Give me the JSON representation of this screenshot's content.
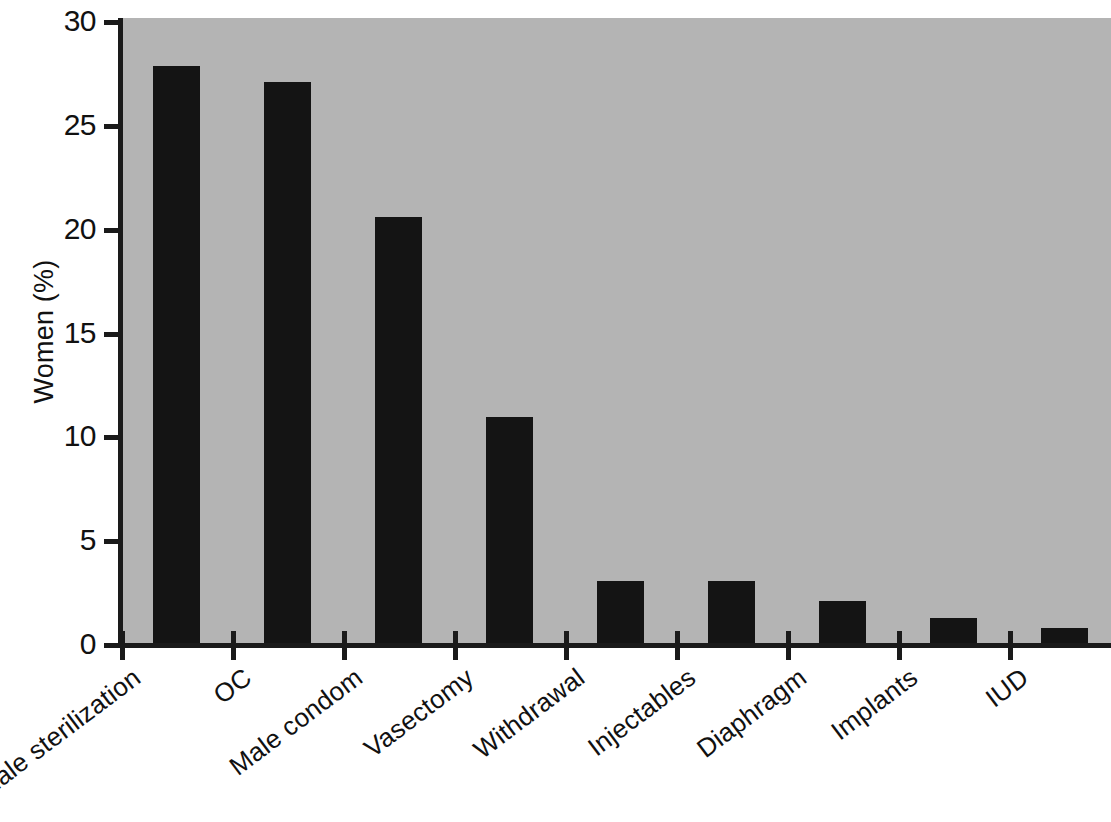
{
  "chart_data": {
    "type": "bar",
    "title": "",
    "subtitle": "",
    "xlabel": "",
    "ylabel": "Women (%)",
    "ylim": [
      0,
      30
    ],
    "ytick_labels": [
      "30",
      "25",
      "20",
      "15",
      "10",
      "5",
      "0"
    ],
    "ytick_values": [
      30,
      25,
      20,
      15,
      10,
      5,
      0
    ],
    "grid": false,
    "legend": null,
    "legend_position": "none",
    "bar_color": "#141414",
    "plot_background_color": "#b4b4b4",
    "figure_background_color": "#ffffff",
    "axis_color": "#1a1a1a",
    "categories": [
      "Female sterilization",
      "OC",
      "Male condom",
      "Vasectomy",
      "Withdrawal",
      "Injectables",
      "Diaphragm",
      "Implants",
      "IUD"
    ],
    "values": [
      27.9,
      27.1,
      20.6,
      11.0,
      3.1,
      3.1,
      2.1,
      1.3,
      0.8
    ]
  }
}
